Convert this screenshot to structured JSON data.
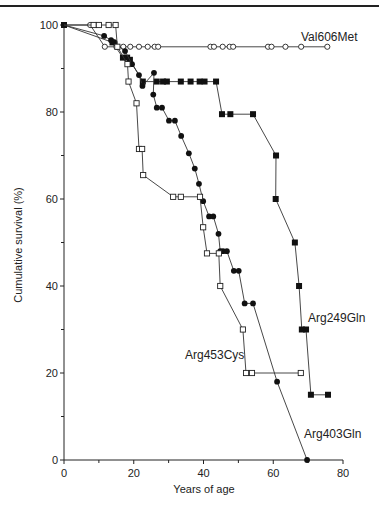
{
  "chart_data": {
    "type": "line",
    "subtype": "kaplan-meier step survival",
    "title": "",
    "xlabel": "Years of age",
    "ylabel": "Cumulative survival (%)",
    "xlim": [
      0,
      80
    ],
    "ylim": [
      0,
      100
    ],
    "x_ticks": [
      0,
      20,
      40,
      60,
      80
    ],
    "x_minor_ticks": [
      10,
      30,
      50,
      70
    ],
    "y_ticks": [
      0,
      20,
      40,
      60,
      80,
      100
    ],
    "y_minor_ticks": [
      10,
      30,
      50,
      70,
      90
    ],
    "grid": false,
    "legend": "inline labels",
    "series": [
      {
        "name": "Val606Met",
        "marker": "open-circle",
        "label_pos": [
          68,
          97.5
        ],
        "points": [
          [
            0,
            100
          ],
          [
            7.5,
            100
          ],
          [
            11.7,
            95
          ],
          [
            15,
            95
          ],
          [
            17,
            95
          ],
          [
            19,
            95
          ],
          [
            21.5,
            95
          ],
          [
            24,
            95
          ],
          [
            26,
            95
          ],
          [
            27,
            95
          ],
          [
            42,
            95
          ],
          [
            43,
            95
          ],
          [
            45.5,
            95
          ],
          [
            47.5,
            95
          ],
          [
            48.5,
            95
          ],
          [
            58.5,
            95
          ],
          [
            59.5,
            95
          ],
          [
            63.5,
            95
          ],
          [
            68,
            95
          ],
          [
            75.5,
            95
          ]
        ]
      },
      {
        "name": "Arg249Gln",
        "marker": "filled-square",
        "label_pos": [
          70,
          32.5
        ],
        "points": [
          [
            0,
            100
          ],
          [
            13.9,
            96
          ],
          [
            16.9,
            92.5
          ],
          [
            18.1,
            92.5
          ],
          [
            18.9,
            92
          ],
          [
            22.6,
            87
          ],
          [
            26.6,
            87
          ],
          [
            28.4,
            87
          ],
          [
            29.5,
            87
          ],
          [
            33.5,
            87
          ],
          [
            36.3,
            87
          ],
          [
            38.9,
            87
          ],
          [
            40.3,
            87
          ],
          [
            43.6,
            87
          ],
          [
            45.3,
            79.5
          ],
          [
            47.7,
            79.5
          ],
          [
            54.2,
            79.5
          ],
          [
            60.8,
            70
          ],
          [
            60.7,
            60
          ],
          [
            66.2,
            50
          ],
          [
            67.4,
            40
          ],
          [
            68.2,
            30
          ],
          [
            69.4,
            30
          ],
          [
            70.8,
            15
          ],
          [
            75.7,
            15
          ]
        ]
      },
      {
        "name": "Arg403Gln",
        "marker": "filled-circle",
        "label_pos": [
          69,
          6
        ],
        "points": [
          [
            0,
            100
          ],
          [
            11.5,
            97.5
          ],
          [
            13.5,
            96.5
          ],
          [
            14.5,
            96
          ],
          [
            17.5,
            94
          ],
          [
            19.5,
            91
          ],
          [
            21.5,
            88.5
          ],
          [
            22.5,
            86
          ],
          [
            25.8,
            89
          ],
          [
            25.6,
            84
          ],
          [
            26.6,
            81
          ],
          [
            28.1,
            81
          ],
          [
            30.1,
            78
          ],
          [
            31.8,
            78
          ],
          [
            33.6,
            74.5
          ],
          [
            35.8,
            70.5
          ],
          [
            37.5,
            67
          ],
          [
            38.7,
            63.5
          ],
          [
            39.9,
            59.5
          ],
          [
            41.6,
            56
          ],
          [
            42.8,
            56
          ],
          [
            44.3,
            52
          ],
          [
            44.8,
            48
          ],
          [
            45.6,
            48
          ],
          [
            46.7,
            48
          ],
          [
            48.7,
            43.5
          ],
          [
            50.1,
            43.5
          ],
          [
            51.8,
            36
          ],
          [
            54.2,
            36
          ],
          [
            61.1,
            18
          ],
          [
            69.7,
            0
          ]
        ]
      },
      {
        "name": "Arg453Cys",
        "marker": "open-square",
        "label_pos": [
          37.5,
          24
        ],
        "points": [
          [
            0,
            100
          ],
          [
            8.5,
            100
          ],
          [
            10,
            100
          ],
          [
            12.8,
            100
          ],
          [
            14.8,
            100
          ],
          [
            15.3,
            95
          ],
          [
            18.2,
            91
          ],
          [
            18.5,
            87
          ],
          [
            20.8,
            82
          ],
          [
            21.5,
            71.5
          ],
          [
            22.4,
            71.5
          ],
          [
            22.7,
            65.5
          ],
          [
            31.3,
            60.5
          ],
          [
            33.5,
            60.5
          ],
          [
            39,
            60.5
          ],
          [
            39.9,
            53.5
          ],
          [
            41,
            47.5
          ],
          [
            44.4,
            47.5
          ],
          [
            44.8,
            40
          ],
          [
            51.3,
            30
          ],
          [
            52.2,
            20
          ],
          [
            53.9,
            20
          ],
          [
            67.9,
            20
          ]
        ]
      }
    ]
  },
  "labels": {
    "ylabel": "Cumulative survival (%)",
    "xlabel": "Years of age",
    "series": {
      "val606met": "Val606Met",
      "arg249gln": "Arg249Gln",
      "arg453cys": "Arg453Cys",
      "arg403gln": "Arg403Gln"
    },
    "y_ticks": [
      "0",
      "20",
      "40",
      "60",
      "80",
      "100"
    ],
    "x_ticks": [
      "0",
      "20",
      "40",
      "60",
      "80"
    ]
  }
}
